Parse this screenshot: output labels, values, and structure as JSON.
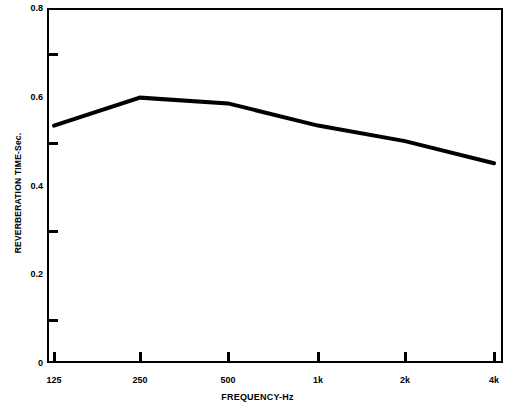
{
  "chart_data": {
    "type": "line",
    "title": "",
    "xlabel": "FREQUENCY-Hz",
    "ylabel": "REVERBERATION TIME-Sec.",
    "categories": [
      "125",
      "250",
      "500",
      "1k",
      "2k",
      "4k"
    ],
    "x_tick_labels": [
      "125",
      "250",
      "500",
      "1k",
      "2k",
      "4k"
    ],
    "y_tick_labels": [
      "0.8",
      "0.6",
      "0.4",
      "0.2",
      "0"
    ],
    "y_minor_ticks": [
      0.7,
      0.5,
      0.3,
      0.1
    ],
    "values": [
      0.535,
      0.598,
      0.585,
      0.535,
      0.5,
      0.45
    ],
    "ylim": [
      0,
      0.8
    ],
    "grid": false,
    "legend": false,
    "line_color": "#000000",
    "line_width_px": 4,
    "background_color": "#ffffff",
    "series": [
      {
        "name": "Reverberation Time",
        "values": [
          0.535,
          0.598,
          0.585,
          0.535,
          0.5,
          0.45
        ]
      }
    ]
  },
  "axes": {
    "x": {
      "title": "FREQUENCY-Hz",
      "ticks": [
        {
          "label": "125",
          "px": 54
        },
        {
          "label": "250",
          "px": 140
        },
        {
          "label": "500",
          "px": 228
        },
        {
          "label": "1k",
          "px": 318
        },
        {
          "label": "2k",
          "px": 405
        },
        {
          "label": "4k",
          "px": 494
        }
      ]
    },
    "y": {
      "title": "REVERBERATION TIME-Sec.",
      "major": [
        {
          "label": "0.8",
          "value": 0.8
        },
        {
          "label": "0.6",
          "value": 0.6
        },
        {
          "label": "0.4",
          "value": 0.4
        },
        {
          "label": "0.2",
          "value": 0.2
        },
        {
          "label": "0",
          "value": 0.0
        }
      ],
      "minor": [
        0.7,
        0.5,
        0.3,
        0.1
      ]
    }
  }
}
